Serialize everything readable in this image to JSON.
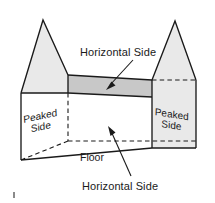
{
  "figure": {
    "labels": {
      "horizontal_side_top": "Horizontal Side",
      "horizontal_side_bottom": "Horizontal Side",
      "floor": "Floor",
      "peaked_side_left_line1": "Peaked",
      "peaked_side_left_line2": "Side",
      "peaked_side_right_line1": "Peaked",
      "peaked_side_right_line2": "Side"
    },
    "colors": {
      "outline": "#1a1a1a",
      "gable_fill": "#e8e8e8",
      "roof_band_fill": "#c9c9c9",
      "front_fill": "#ffffff",
      "background": "#ffffff",
      "text": "#1a1a1a",
      "tick": "#8a8a8a"
    },
    "geometry": {
      "left_gable": "21,93 43,20 68,75 68,93",
      "right_gable": "152,80 175,21 196,80 196,148 152,148",
      "roof_band": "68,75 152,80 152,97 68,93",
      "front_face": "21,93 68,93 152,97 152,148 68,160 21,160",
      "left_apex": [
        43,
        20
      ],
      "right_apex": [
        175,
        21
      ],
      "floor_back_corner": [
        68,
        140
      ],
      "arrow_top_from": [
        133,
        62
      ],
      "arrow_top_to": [
        108,
        88
      ],
      "arrow_bottom_from": [
        130,
        178
      ],
      "arrow_bottom_to": [
        110,
        130
      ]
    }
  }
}
